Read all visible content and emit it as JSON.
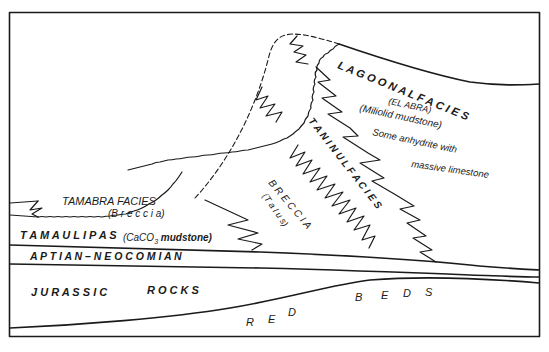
{
  "diagram": {
    "type": "geologic-cross-section",
    "units": {
      "lagoonal": {
        "title": "L A G O O N A L   F A C I E S",
        "subtitle_1": "(EL  ABRA)",
        "subtitle_2": "(Miliolid  mudstone)",
        "note_1": "Some  anhydrite  with",
        "note_2": "massive  limestone"
      },
      "taninul": {
        "title": "T A N I N U L   F A C I E S"
      },
      "breccia": {
        "title": "B R E C C I A",
        "subtitle": "(T a l u s)"
      },
      "tamabra": {
        "title": "TAMABRA   FACIES",
        "subtitle": "(B r e c c i a)"
      },
      "tamaulipas": {
        "title": "T A M A U L I P A S",
        "subtitle_pre": "(CaCO",
        "subtitle_sub": "3",
        "subtitle_post": " mudstone)"
      },
      "aptian": {
        "title": "A P T I A N – N E O C O M I A N"
      },
      "jurassic": {
        "word1": "J U R A S S I C",
        "word2": "R O C K S"
      },
      "red_beds": {
        "letters": [
          "R",
          "E",
          "D",
          "B",
          "E",
          "D",
          "S"
        ]
      }
    },
    "colors": {
      "line": "#1a1a1a",
      "background": "#ffffff"
    }
  }
}
